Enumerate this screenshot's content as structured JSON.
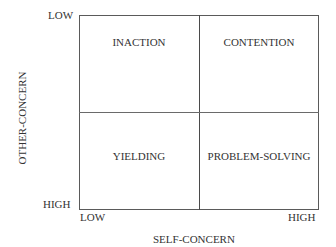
{
  "diagram": {
    "type": "2x2 matrix",
    "quadrants": {
      "top_left": "INACTION",
      "top_right": "CONTENTION",
      "bottom_left": "YIELDING",
      "bottom_right": "PROBLEM-SOLVING"
    },
    "y_axis": {
      "label": "OTHER-CONCERN",
      "top_tick": "LOW",
      "bottom_tick": "HIGH"
    },
    "x_axis": {
      "label": "SELF-CONCERN",
      "left_tick": "LOW",
      "right_tick": "HIGH"
    }
  }
}
